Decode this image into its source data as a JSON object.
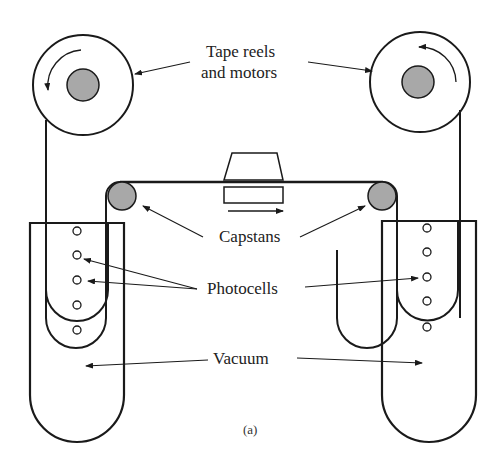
{
  "figure": {
    "caption": "(a)",
    "labels": {
      "reels_line1": "Tape reels",
      "reels_line2": "and motors",
      "capstans": "Capstans",
      "photocells": "Photocells",
      "vacuum": "Vacuum"
    },
    "colors": {
      "stroke": "#1a1a1a",
      "hub_fill": "#a8a8a8",
      "background": "#ffffff"
    }
  }
}
